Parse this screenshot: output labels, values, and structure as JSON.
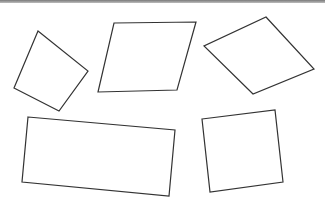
{
  "canvas": {
    "width": 325,
    "height": 208,
    "background": "#ffffff",
    "stroke": "#333333",
    "border_color": "#7a7a7a"
  },
  "shapes": [
    {
      "name": "quadrilateral-1",
      "points": "38,31 88,71 59,111 14,88"
    },
    {
      "name": "quadrilateral-2",
      "points": "114,23 196,22 177,90 98,92"
    },
    {
      "name": "quadrilateral-3",
      "points": "266,17 314,69 253,94 204,46"
    },
    {
      "name": "quadrilateral-4",
      "points": "28,117 175,130 169,196 22,182"
    },
    {
      "name": "quadrilateral-5",
      "points": "202,119 275,110 283,182 210,192"
    }
  ]
}
